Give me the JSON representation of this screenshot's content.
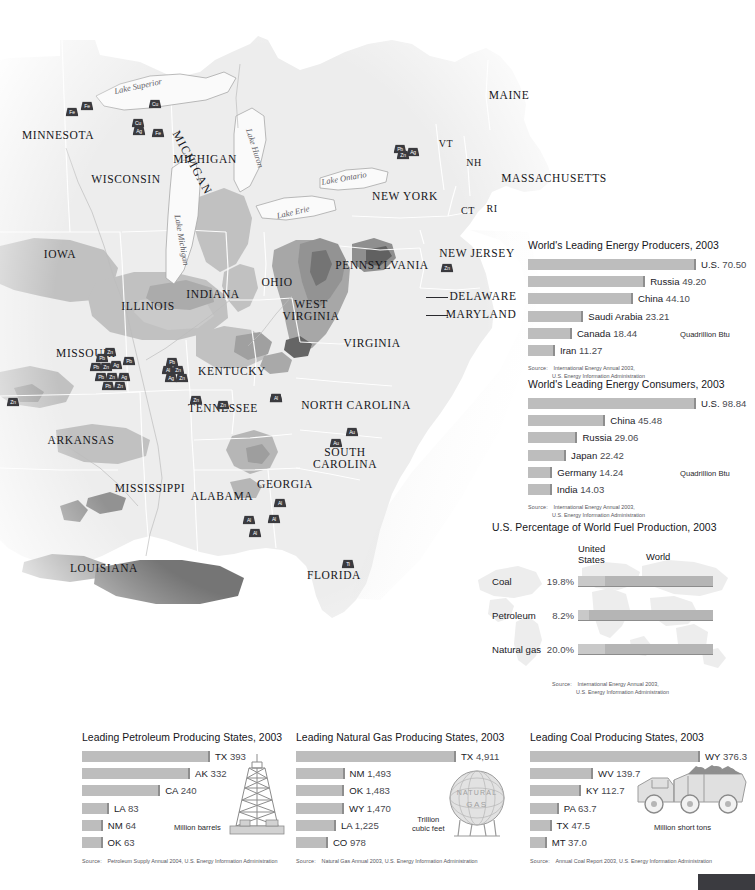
{
  "map": {
    "states": [
      {
        "name": "MINNESOTA",
        "x": 58,
        "y": 136
      },
      {
        "name": "WISCONSIN",
        "x": 126,
        "y": 180
      },
      {
        "name": "MICHIGAN",
        "x": 205,
        "y": 160
      },
      {
        "name": "IOWA",
        "x": 60,
        "y": 255
      },
      {
        "name": "ILLINOIS",
        "x": 148,
        "y": 307
      },
      {
        "name": "INDIANA",
        "x": 213,
        "y": 295
      },
      {
        "name": "OHIO",
        "x": 277,
        "y": 283
      },
      {
        "name": "MISSOURI",
        "x": 86,
        "y": 354
      },
      {
        "name": "KENTUCKY",
        "x": 232,
        "y": 372
      },
      {
        "name": "TENNESSEE",
        "x": 223,
        "y": 409
      },
      {
        "name": "ARKANSAS",
        "x": 81,
        "y": 441
      },
      {
        "name": "MISSISSIPPI",
        "x": 150,
        "y": 489
      },
      {
        "name": "ALABAMA",
        "x": 222,
        "y": 497
      },
      {
        "name": "LOUISIANA",
        "x": 104,
        "y": 569
      },
      {
        "name": "GEORGIA",
        "x": 285,
        "y": 485
      },
      {
        "name": "FLORIDA",
        "x": 334,
        "y": 576
      },
      {
        "name": "SOUTH CAROLINA",
        "x": 345,
        "y": 459
      },
      {
        "name": "NORTH CAROLINA",
        "x": 356,
        "y": 406
      },
      {
        "name": "VIRGINIA",
        "x": 372,
        "y": 344
      },
      {
        "name": "WEST VIRGINIA",
        "x": 311,
        "y": 311
      },
      {
        "name": "PENNSYLVANIA",
        "x": 382,
        "y": 266
      },
      {
        "name": "NEW YORK",
        "x": 405,
        "y": 197
      },
      {
        "name": "NEW JERSEY",
        "x": 477,
        "y": 254
      },
      {
        "name": "MAINE",
        "x": 509,
        "y": 96
      },
      {
        "name": "MASSACHUSETTS",
        "x": 554,
        "y": 179
      },
      {
        "name": "DELAWARE",
        "x": 483,
        "y": 297
      },
      {
        "name": "MARYLAND",
        "x": 481,
        "y": 315
      }
    ],
    "states_small": [
      {
        "name": "VT",
        "x": 446,
        "y": 144
      },
      {
        "name": "NH",
        "x": 474,
        "y": 163
      },
      {
        "name": "CT",
        "x": 468,
        "y": 211
      },
      {
        "name": "RI",
        "x": 492,
        "y": 209
      }
    ],
    "lakes": [
      {
        "name": "Lake Superior",
        "x": 138,
        "y": 86,
        "rot": -12
      },
      {
        "name": "Lake Michigan",
        "x": 182,
        "y": 240,
        "rot": 80
      },
      {
        "name": "Lake Huron",
        "x": 255,
        "y": 148,
        "rot": 72
      },
      {
        "name": "Lake Erie",
        "x": 293,
        "y": 212,
        "rot": -13
      },
      {
        "name": "Lake Ontario",
        "x": 344,
        "y": 178,
        "rot": -10
      }
    ],
    "mines": [
      {
        "symbol": "Fe",
        "x": 72,
        "y": 112
      },
      {
        "symbol": "Fe",
        "x": 87,
        "y": 106
      },
      {
        "symbol": "Cu",
        "x": 155,
        "y": 104
      },
      {
        "symbol": "Cu",
        "x": 138,
        "y": 123
      },
      {
        "symbol": "Ag",
        "x": 139,
        "y": 131
      },
      {
        "symbol": "Fe",
        "x": 158,
        "y": 133
      },
      {
        "symbol": "Pb",
        "x": 400,
        "y": 149
      },
      {
        "symbol": "Zn",
        "x": 403,
        "y": 155
      },
      {
        "symbol": "Ag",
        "x": 413,
        "y": 152
      },
      {
        "symbol": "Zn",
        "x": 447,
        "y": 268
      },
      {
        "symbol": "Pb",
        "x": 102,
        "y": 358
      },
      {
        "symbol": "Zn",
        "x": 110,
        "y": 352
      },
      {
        "symbol": "Pb",
        "x": 96,
        "y": 367
      },
      {
        "symbol": "Zn",
        "x": 106,
        "y": 367
      },
      {
        "symbol": "Ag",
        "x": 116,
        "y": 365
      },
      {
        "symbol": "Pb",
        "x": 129,
        "y": 361
      },
      {
        "symbol": "Pb",
        "x": 101,
        "y": 377
      },
      {
        "symbol": "Zn",
        "x": 112,
        "y": 377
      },
      {
        "symbol": "Ag",
        "x": 124,
        "y": 377
      },
      {
        "symbol": "Pb",
        "x": 108,
        "y": 386
      },
      {
        "symbol": "Zn",
        "x": 120,
        "y": 386
      },
      {
        "symbol": "Pb",
        "x": 172,
        "y": 362
      },
      {
        "symbol": "Al",
        "x": 168,
        "y": 370
      },
      {
        "symbol": "Zn",
        "x": 178,
        "y": 370
      },
      {
        "symbol": "Ag",
        "x": 171,
        "y": 378
      },
      {
        "symbol": "Zn",
        "x": 182,
        "y": 378
      },
      {
        "symbol": "Zn",
        "x": 13,
        "y": 402
      },
      {
        "symbol": "Zn",
        "x": 196,
        "y": 400
      },
      {
        "symbol": "Zn",
        "x": 223,
        "y": 405
      },
      {
        "symbol": "Zn",
        "x": 276,
        "y": 398
      },
      {
        "symbol": "Al",
        "x": 276,
        "y": 398
      },
      {
        "symbol": "Au",
        "x": 352,
        "y": 432
      },
      {
        "symbol": "Au",
        "x": 336,
        "y": 443
      },
      {
        "symbol": "Al",
        "x": 280,
        "y": 503
      },
      {
        "symbol": "Al",
        "x": 249,
        "y": 520
      },
      {
        "symbol": "Al",
        "x": 274,
        "y": 519
      },
      {
        "symbol": "Al",
        "x": 255,
        "y": 533
      },
      {
        "symbol": "Ti",
        "x": 348,
        "y": 564
      }
    ]
  },
  "producers_chart": {
    "title": "World's Leading Energy Producers, 2003",
    "unit": "Quadrillion Btu",
    "source_label": "Source:",
    "source_line1": "International Energy Annual 2003,",
    "source_line2": "U.S. Energy Information Administration",
    "max": 70.5,
    "bar_scale_px": 168,
    "rows": [
      {
        "name": "U.S.",
        "value": "70.50"
      },
      {
        "name": "Russia",
        "value": "49.20"
      },
      {
        "name": "China",
        "value": "44.10"
      },
      {
        "name": "Saudi Arabia",
        "value": "23.21"
      },
      {
        "name": "Canada",
        "value": "18.44"
      },
      {
        "name": "Iran",
        "value": "11.27"
      }
    ]
  },
  "consumers_chart": {
    "title": "World's Leading Energy Consumers, 2003",
    "unit": "Quadrillion Btu",
    "source_label": "Source:",
    "source_line1": "International Energy Annual 2003,",
    "source_line2": "U.S. Energy Information Administration",
    "max": 98.84,
    "bar_scale_px": 168,
    "rows": [
      {
        "name": "U.S.",
        "value": "98.84"
      },
      {
        "name": "China",
        "value": "45.48"
      },
      {
        "name": "Russia",
        "value": "29.06"
      },
      {
        "name": "Japan",
        "value": "22.42"
      },
      {
        "name": "Germany",
        "value": "14.24"
      },
      {
        "name": "India",
        "value": "14.03"
      }
    ]
  },
  "fuel_chart": {
    "title": "U.S. Percentage of World Fuel Production, 2003",
    "col_us_line1": "United",
    "col_us_line2": "States",
    "col_world": "World",
    "source_label": "Source:",
    "source_line1": "International Energy Annual 2003,",
    "source_line2": "U.S. Energy Information Administration",
    "rows": [
      {
        "name": "Coal",
        "pct": "19.8%",
        "value": 19.8
      },
      {
        "name": "Petroleum",
        "pct": "8.2%",
        "value": 8.2
      },
      {
        "name": "Natural gas",
        "pct": "20.0%",
        "value": 20.0
      }
    ]
  },
  "petroleum_chart": {
    "title": "Leading Petroleum Producing States, 2003",
    "unit": "Million barrels",
    "source_label": "Source:",
    "source_line1": "Petroleum Supply Annual 2004, U.S. Energy Information Administration",
    "max": 393,
    "bar_scale_px": 128,
    "rows": [
      {
        "name": "TX",
        "value": "393"
      },
      {
        "name": "AK",
        "value": "332"
      },
      {
        "name": "CA",
        "value": "240"
      },
      {
        "name": "LA",
        "value": "83"
      },
      {
        "name": "NM",
        "value": "64"
      },
      {
        "name": "OK",
        "value": "63"
      }
    ],
    "illustration": "oil-derrick"
  },
  "gas_chart": {
    "title": "Leading Natural Gas Producing States, 2003",
    "unit_line1": "Trillion",
    "unit_line2": "cubic feet",
    "source_label": "Source:",
    "source_line1": "Natural Gas Annual 2003, U.S. Energy Information Administration",
    "max": 4911,
    "bar_scale_px": 160,
    "rows": [
      {
        "name": "TX",
        "value": "4,911"
      },
      {
        "name": "NM",
        "value": "1,493"
      },
      {
        "name": "OK",
        "value": "1,483"
      },
      {
        "name": "WY",
        "value": "1,470"
      },
      {
        "name": "LA",
        "value": "1,225"
      },
      {
        "name": "CO",
        "value": "978"
      }
    ],
    "illustration": "gas-tank",
    "illustration_text_line1": "NATURAL",
    "illustration_text_line2": "GAS"
  },
  "coal_chart": {
    "title": "Leading Coal Producing States, 2003",
    "unit": "Million short tons",
    "source_label": "Source:",
    "source_line1": "Annual Coal Report 2003, U.S. Energy Information Administration",
    "max": 376.3,
    "bar_scale_px": 170,
    "rows": [
      {
        "name": "WY",
        "value": "376.3"
      },
      {
        "name": "WV",
        "value": "139.7"
      },
      {
        "name": "KY",
        "value": "112.7"
      },
      {
        "name": "PA",
        "value": "63.7"
      },
      {
        "name": "TX",
        "value": "47.5"
      },
      {
        "name": "MT",
        "value": "37.0"
      }
    ],
    "illustration": "coal-truck"
  },
  "colors": {
    "bar_fill": "#bdbdbd",
    "bar_shadow": "#8e8e8e",
    "map_land": "#ededed",
    "map_resource_mid": "#bfbfbf",
    "map_resource_dark": "#8f8f8f",
    "text": "#15151a"
  }
}
